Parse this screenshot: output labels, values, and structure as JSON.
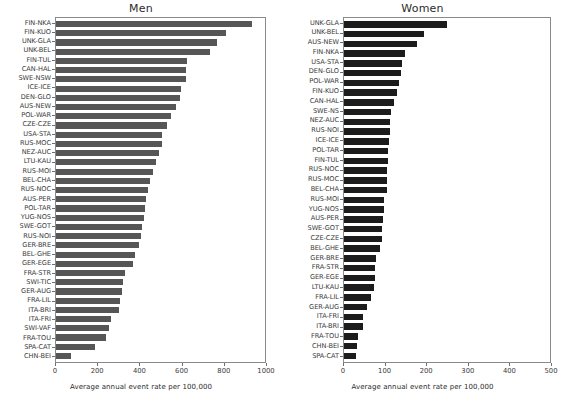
{
  "chart_data": [
    {
      "type": "bar",
      "title": "Men",
      "orientation": "horizontal",
      "xlabel": "Average annual event rate per 100,000",
      "ylabel": "",
      "xlim": [
        0,
        1000
      ],
      "xticks": [
        0,
        200,
        400,
        600,
        800,
        1000
      ],
      "xticklabels": [
        "0",
        "200",
        "400",
        "600",
        "800",
        "1000"
      ],
      "grid": false,
      "legend": false,
      "bar_color": "#565656",
      "categories": [
        "FIN-NKA",
        "FIN-KUO",
        "UNK-GLA",
        "UNK-BEL",
        "FIN-TUL",
        "CAN-HAL",
        "SWE-NSW",
        "ICE-ICE",
        "DEN-GLO",
        "AUS-NEW",
        "POL-WAR",
        "CZE-CZE",
        "USA-STA",
        "RUS-MOC",
        "NEZ-AUC",
        "LTU-KAU",
        "RUS-MOI",
        "BEL-CHA",
        "RUS-NOC",
        "AUS-PER",
        "POL-TAR",
        "YUG-NOS",
        "SWE-GOT",
        "RUS-NOI",
        "GER-BRE",
        "BEL-GHE",
        "GER-EGE",
        "FRA-STR",
        "SWI-TIC",
        "GER-AUG",
        "FRA-LIL",
        "ITA-BRI",
        "ITA-FRI",
        "SWI-VAF",
        "FRA-TOU",
        "SPA-CAT",
        "CHN-BEI"
      ],
      "values": [
        940,
        815,
        772,
        738,
        625,
        623,
        620,
        600,
        592,
        572,
        548,
        530,
        508,
        505,
        492,
        478,
        462,
        452,
        438,
        430,
        425,
        420,
        412,
        405,
        398,
        378,
        370,
        330,
        322,
        315,
        308,
        300,
        265,
        255,
        240,
        185,
        70
      ]
    },
    {
      "type": "bar",
      "title": "Women",
      "orientation": "horizontal",
      "xlabel": "Average annual event rate per 100,000",
      "ylabel": "",
      "xlim": [
        0,
        500
      ],
      "xticks": [
        0,
        100,
        200,
        300,
        400,
        500
      ],
      "xticklabels": [
        "0",
        "100",
        "200",
        "300",
        "400",
        "500"
      ],
      "grid": false,
      "legend": false,
      "bar_color": "#1c1c1c",
      "categories": [
        "UNK-GLA",
        "UNK-BEL",
        "AUS-NEW",
        "FIN-NKA",
        "USA-STA",
        "DEN-GLO",
        "POL-WAR",
        "FIN-KUO",
        "CAN-HAL",
        "SWE-NS",
        "NEZ-AUC",
        "RUS-NOI",
        "ICE-ICE",
        "POL-TAR",
        "FIN-TUL",
        "RUS-NOC",
        "RUS-MOC",
        "BEL-CHA",
        "RUS-MOI",
        "YUG-NOS",
        "AUS-PER",
        "SWE-GOT",
        "CZE-CZE",
        "BEL-GHE",
        "GER-BRE",
        "FRA-STR",
        "GER-EGE",
        "LTU-KAU",
        "FRA-LIL",
        "GER-AUG",
        "ITA-FRI",
        "ITA-BRI",
        "FRA-TOU",
        "CHN-BEI",
        "SPA-CAT"
      ],
      "values": [
        250,
        193,
        177,
        148,
        140,
        138,
        133,
        128,
        122,
        115,
        112,
        112,
        110,
        108,
        107,
        105,
        104,
        104,
        98,
        96,
        95,
        93,
        93,
        87,
        78,
        75,
        75,
        73,
        66,
        56,
        47,
        46,
        34,
        32,
        28
      ]
    }
  ]
}
